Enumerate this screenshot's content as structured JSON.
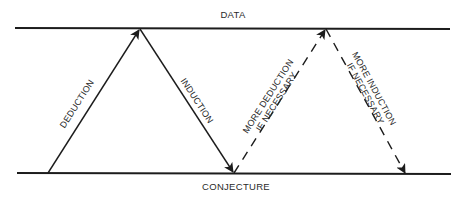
{
  "diagram": {
    "type": "inductive-deductive-cycle",
    "top_label": "DATA",
    "bottom_label": "CONJECTURE",
    "arrows": [
      {
        "id": "deduction",
        "label_line1": "DEDUCTION",
        "label_line2": "",
        "style": "solid",
        "from": "CONJECTURE",
        "to": "DATA"
      },
      {
        "id": "induction",
        "label_line1": "INDUCTION",
        "label_line2": "",
        "style": "solid",
        "from": "DATA",
        "to": "CONJECTURE"
      },
      {
        "id": "more-deduction",
        "label_line1": "MORE DEDUCTION",
        "label_line2": "IF NECESSARY",
        "style": "dashed",
        "from": "CONJECTURE",
        "to": "DATA"
      },
      {
        "id": "more-induction",
        "label_line1": "MORE INDUCTION",
        "label_line2": "IF NECESSARY",
        "style": "dashed",
        "from": "DATA",
        "to": "CONJECTURE"
      }
    ],
    "colors": {
      "line": "#1c1c1c",
      "text": "#2a2a2a",
      "background": "#ffffff"
    }
  }
}
